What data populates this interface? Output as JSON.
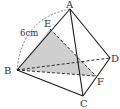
{
  "figure": {
    "type": "tetrahedron-cross-section",
    "vertices": {
      "A": {
        "label": "A",
        "x": 70,
        "y": 9
      },
      "B": {
        "label": "B",
        "x": 17,
        "y": 70
      },
      "C": {
        "label": "C",
        "x": 83,
        "y": 96
      },
      "D": {
        "label": "D",
        "x": 110,
        "y": 58
      },
      "E": {
        "label": "E",
        "x": 50,
        "y": 29
      },
      "F": {
        "label": "F",
        "x": 96,
        "y": 76
      }
    },
    "measurement": {
      "label": "6cm",
      "segment": "AB"
    },
    "shaded_region": [
      "B",
      "E",
      "F"
    ],
    "colors": {
      "line": "#1a1a1a",
      "shade": "#cfcfcf",
      "label": "#333333"
    }
  }
}
